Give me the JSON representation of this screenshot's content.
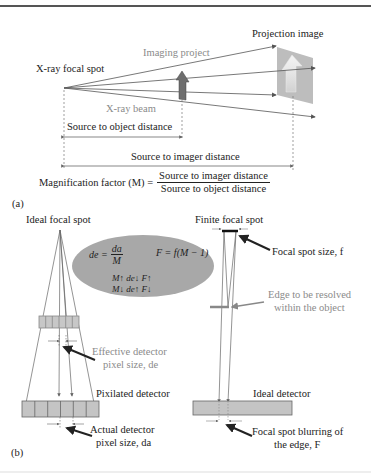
{
  "panel_a": {
    "label": "(a)",
    "focal_spot_label": "X-ray focal spot",
    "imaging_object_label": "Imaging project",
    "projection_image_label": "Projection image",
    "beam_label": "X-ray beam",
    "source_object_distance_label": "Source to object distance",
    "source_imager_distance_label": "Source to imager distance",
    "magnification": {
      "lhs": "Magnification factor (M) =",
      "numerator": "Source to imager distance",
      "denominator": "Source to object distance"
    }
  },
  "panel_b": {
    "label": "(b)",
    "left": {
      "title": "Ideal focal spot",
      "effective_pixel_label_1": "Effective detector",
      "effective_pixel_label_2": "pixel size, de",
      "pixilated_detector_label": "Pixilated detector",
      "actual_pixel_label_1": "Actual detector",
      "actual_pixel_label_2": "pixel size, da"
    },
    "ellipse": {
      "de_lhs": "de =",
      "de_num": "da",
      "de_den": "M",
      "F_eq": "F = f(M − 1)",
      "row1": "M↑  de↓  F↑",
      "row2": "M↓  de↑  F↓"
    },
    "right": {
      "title": "Finite focal spot",
      "focal_spot_size_label": "Focal spot size, f",
      "edge_label_1": "Edge to be resolved",
      "edge_label_2": "within the object",
      "ideal_detector_label": "Ideal detector",
      "blur_label_1": "Focal spot blurring of",
      "blur_label_2": "the edge, F"
    }
  },
  "colors": {
    "line": "#555555",
    "object_fill": "#6e6e6e",
    "projection_fill": "#bdbdbd",
    "ellipse_fill": "#a8a8a8",
    "detector_fill": "#c4c4c4",
    "gray_text": "#8a8a8a"
  }
}
